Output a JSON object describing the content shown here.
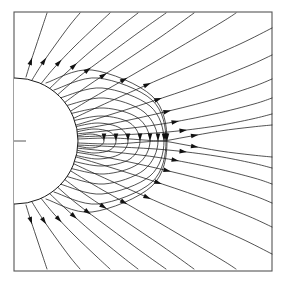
{
  "figure": {
    "title": "",
    "caption": "",
    "kind": "field-line-diagram",
    "background_color": "#ffffff",
    "line_color": "#1a1a1a",
    "frame_color": "#555555"
  },
  "frame": {
    "x": 14,
    "y": 12,
    "width": 258,
    "height": 259,
    "stroke_width": 1.1
  },
  "body": {
    "name": "central-sphere",
    "center_x": 15,
    "center_y": 141,
    "radius": 63,
    "fill": "#ffffff",
    "stroke": "#1a1a1a",
    "visible_portion": "right half"
  },
  "equator_tick": {
    "x1": 14,
    "x2": 26,
    "y": 141
  },
  "chart_data": {
    "type": "line",
    "title": "",
    "xlabel": "",
    "ylabel": "",
    "xlim": [
      14,
      272
    ],
    "ylim": [
      12,
      271
    ],
    "grid": false,
    "legend": null,
    "annotations": [
      {
        "label": "neutral-point",
        "x": 166,
        "y": 141
      },
      {
        "label": "equator-tick-left",
        "x": 20,
        "y": 141
      },
      {
        "label": "equator-exit-right",
        "x": 272,
        "y": 141
      }
    ],
    "arrow_count": 39,
    "open_lines_upper": 12,
    "open_lines_lower": 12,
    "closed_loops": 9,
    "series": [
      {
        "name": "open-upper-1",
        "arrow_t": 0.3,
        "points": [
          [
            26,
            77
          ],
          [
            30,
            64
          ],
          [
            36,
            46
          ],
          [
            42,
            28
          ],
          [
            47,
            13
          ]
        ]
      },
      {
        "name": "open-upper-2",
        "arrow_t": 0.32,
        "points": [
          [
            32,
            80
          ],
          [
            42,
            64
          ],
          [
            56,
            44
          ],
          [
            70,
            25
          ],
          [
            80,
            13
          ]
        ]
      },
      {
        "name": "open-upper-3",
        "arrow_t": 0.33,
        "points": [
          [
            40,
            85
          ],
          [
            54,
            68
          ],
          [
            74,
            47
          ],
          [
            96,
            26
          ],
          [
            110,
            13
          ]
        ]
      },
      {
        "name": "open-upper-4",
        "arrow_t": 0.34,
        "points": [
          [
            47,
            91
          ],
          [
            66,
            73
          ],
          [
            92,
            50
          ],
          [
            120,
            27
          ],
          [
            138,
            13
          ]
        ]
      },
      {
        "name": "open-upper-5",
        "arrow_t": 0.34,
        "points": [
          [
            54,
            98
          ],
          [
            76,
            79
          ],
          [
            108,
            55
          ],
          [
            142,
            30
          ],
          [
            166,
            13
          ]
        ]
      },
      {
        "name": "open-upper-6",
        "arrow_t": 0.35,
        "points": [
          [
            60,
            106
          ],
          [
            86,
            87
          ],
          [
            122,
            63
          ],
          [
            162,
            36
          ],
          [
            194,
            13
          ]
        ]
      },
      {
        "name": "open-upper-7",
        "arrow_t": 0.36,
        "points": [
          [
            66,
            114
          ],
          [
            94,
            97
          ],
          [
            134,
            74
          ],
          [
            180,
            47
          ],
          [
            222,
            22
          ],
          [
            236,
            13
          ]
        ]
      },
      {
        "name": "open-upper-8",
        "arrow_t": 0.4,
        "points": [
          [
            70,
            120
          ],
          [
            100,
            106
          ],
          [
            142,
            87
          ],
          [
            190,
            66
          ],
          [
            240,
            44
          ],
          [
            272,
            28
          ]
        ]
      },
      {
        "name": "open-upper-9",
        "arrow_t": 0.44,
        "points": [
          [
            73,
            126
          ],
          [
            106,
            116
          ],
          [
            150,
            102
          ],
          [
            200,
            85
          ],
          [
            248,
            66
          ],
          [
            272,
            55
          ]
        ]
      },
      {
        "name": "open-upper-10",
        "arrow_t": 0.48,
        "points": [
          [
            75,
            130
          ],
          [
            110,
            124
          ],
          [
            156,
            114
          ],
          [
            208,
            101
          ],
          [
            252,
            87
          ],
          [
            272,
            79
          ]
        ]
      },
      {
        "name": "open-upper-11",
        "arrow_t": 0.52,
        "points": [
          [
            76,
            134
          ],
          [
            114,
            130
          ],
          [
            162,
            124
          ],
          [
            214,
            114
          ],
          [
            254,
            104
          ],
          [
            272,
            98
          ]
        ]
      },
      {
        "name": "open-upper-12",
        "arrow_t": 0.56,
        "points": [
          [
            77,
            137
          ],
          [
            120,
            135
          ],
          [
            168,
            132
          ],
          [
            216,
            126
          ],
          [
            252,
            119
          ],
          [
            272,
            114
          ]
        ]
      },
      {
        "name": "separatrix-upper",
        "arrow_t": 0.62,
        "points": [
          [
            78,
            139
          ],
          [
            112,
            138
          ],
          [
            144,
            140
          ],
          [
            162,
            141
          ],
          [
            186,
            137
          ],
          [
            220,
            131
          ],
          [
            252,
            127
          ],
          [
            272,
            125
          ]
        ]
      },
      {
        "name": "separatrix-lower",
        "arrow_t": 0.62,
        "points": [
          [
            78,
            143
          ],
          [
            112,
            144
          ],
          [
            144,
            142
          ],
          [
            162,
            141
          ],
          [
            186,
            145
          ],
          [
            220,
            151
          ],
          [
            252,
            155
          ],
          [
            272,
            157
          ]
        ]
      },
      {
        "name": "open-lower-12",
        "arrow_t": 0.56,
        "points": [
          [
            77,
            145
          ],
          [
            120,
            147
          ],
          [
            168,
            150
          ],
          [
            216,
            156
          ],
          [
            252,
            163
          ],
          [
            272,
            168
          ]
        ]
      },
      {
        "name": "open-lower-11",
        "arrow_t": 0.52,
        "points": [
          [
            76,
            148
          ],
          [
            114,
            152
          ],
          [
            162,
            158
          ],
          [
            214,
            168
          ],
          [
            254,
            178
          ],
          [
            272,
            184
          ]
        ]
      },
      {
        "name": "open-lower-10",
        "arrow_t": 0.48,
        "points": [
          [
            75,
            152
          ],
          [
            110,
            158
          ],
          [
            156,
            168
          ],
          [
            208,
            181
          ],
          [
            252,
            195
          ],
          [
            272,
            203
          ]
        ]
      },
      {
        "name": "open-lower-9",
        "arrow_t": 0.44,
        "points": [
          [
            73,
            156
          ],
          [
            106,
            166
          ],
          [
            150,
            180
          ],
          [
            200,
            197
          ],
          [
            248,
            216
          ],
          [
            272,
            227
          ]
        ]
      },
      {
        "name": "open-lower-8",
        "arrow_t": 0.4,
        "points": [
          [
            70,
            162
          ],
          [
            100,
            176
          ],
          [
            142,
            195
          ],
          [
            190,
            216
          ],
          [
            240,
            238
          ],
          [
            272,
            254
          ]
        ]
      },
      {
        "name": "open-lower-7",
        "arrow_t": 0.36,
        "points": [
          [
            66,
            168
          ],
          [
            94,
            185
          ],
          [
            134,
            208
          ],
          [
            180,
            235
          ],
          [
            222,
            260
          ],
          [
            236,
            269
          ]
        ]
      },
      {
        "name": "open-lower-6",
        "arrow_t": 0.35,
        "points": [
          [
            60,
            176
          ],
          [
            86,
            195
          ],
          [
            122,
            219
          ],
          [
            162,
            246
          ],
          [
            194,
            269
          ]
        ]
      },
      {
        "name": "open-lower-5",
        "arrow_t": 0.34,
        "points": [
          [
            54,
            184
          ],
          [
            76,
            203
          ],
          [
            108,
            227
          ],
          [
            142,
            252
          ],
          [
            166,
            269
          ]
        ]
      },
      {
        "name": "open-lower-4",
        "arrow_t": 0.34,
        "points": [
          [
            47,
            191
          ],
          [
            66,
            209
          ],
          [
            92,
            232
          ],
          [
            120,
            255
          ],
          [
            138,
            269
          ]
        ]
      },
      {
        "name": "open-lower-3",
        "arrow_t": 0.33,
        "points": [
          [
            40,
            197
          ],
          [
            54,
            214
          ],
          [
            74,
            235
          ],
          [
            96,
            256
          ],
          [
            110,
            269
          ]
        ]
      },
      {
        "name": "open-lower-2",
        "arrow_t": 0.32,
        "points": [
          [
            32,
            202
          ],
          [
            42,
            218
          ],
          [
            56,
            238
          ],
          [
            70,
            257
          ],
          [
            80,
            269
          ]
        ]
      },
      {
        "name": "open-lower-1",
        "arrow_t": 0.3,
        "points": [
          [
            26,
            205
          ],
          [
            30,
            218
          ],
          [
            36,
            236
          ],
          [
            42,
            254
          ],
          [
            47,
            269
          ]
        ]
      },
      {
        "name": "closed-loop-1",
        "arrow_t": 0.5,
        "points": [
          [
            77,
            136
          ],
          [
            90,
            134
          ],
          [
            100,
            136
          ],
          [
            104,
            141
          ],
          [
            100,
            146
          ],
          [
            90,
            148
          ],
          [
            77,
            146
          ]
        ]
      },
      {
        "name": "closed-loop-2",
        "arrow_t": 0.5,
        "points": [
          [
            76,
            132
          ],
          [
            94,
            129
          ],
          [
            110,
            132
          ],
          [
            116,
            141
          ],
          [
            110,
            150
          ],
          [
            94,
            153
          ],
          [
            76,
            150
          ]
        ]
      },
      {
        "name": "closed-loop-3",
        "arrow_t": 0.5,
        "points": [
          [
            74,
            127
          ],
          [
            98,
            123
          ],
          [
            120,
            128
          ],
          [
            128,
            141
          ],
          [
            120,
            154
          ],
          [
            98,
            159
          ],
          [
            74,
            155
          ]
        ]
      },
      {
        "name": "closed-loop-4",
        "arrow_t": 0.5,
        "points": [
          [
            72,
            121
          ],
          [
            102,
            116
          ],
          [
            130,
            123
          ],
          [
            140,
            141
          ],
          [
            130,
            159
          ],
          [
            102,
            166
          ],
          [
            72,
            161
          ]
        ]
      },
      {
        "name": "closed-loop-5",
        "arrow_t": 0.5,
        "points": [
          [
            69,
            114
          ],
          [
            104,
            108
          ],
          [
            138,
            118
          ],
          [
            150,
            141
          ],
          [
            138,
            164
          ],
          [
            104,
            174
          ],
          [
            69,
            168
          ]
        ]
      },
      {
        "name": "closed-loop-6",
        "arrow_t": 0.5,
        "points": [
          [
            65,
            106
          ],
          [
            104,
            98
          ],
          [
            144,
            112
          ],
          [
            158,
            141
          ],
          [
            144,
            170
          ],
          [
            104,
            184
          ],
          [
            65,
            176
          ]
        ]
      },
      {
        "name": "closed-loop-7",
        "arrow_t": 0.5,
        "points": [
          [
            60,
            98
          ],
          [
            102,
            88
          ],
          [
            150,
            106
          ],
          [
            164,
            141
          ],
          [
            150,
            176
          ],
          [
            102,
            194
          ],
          [
            60,
            184
          ]
        ]
      },
      {
        "name": "closed-loop-8",
        "arrow_t": 0.5,
        "points": [
          [
            54,
            90
          ],
          [
            98,
            78
          ],
          [
            152,
            100
          ],
          [
            166,
            141
          ],
          [
            152,
            182
          ],
          [
            98,
            204
          ],
          [
            54,
            192
          ]
        ]
      },
      {
        "name": "closed-loop-9",
        "arrow_t": 0.5,
        "points": [
          [
            46,
            83
          ],
          [
            92,
            70
          ],
          [
            152,
            96
          ],
          [
            167,
            141
          ],
          [
            152,
            186
          ],
          [
            92,
            212
          ],
          [
            46,
            199
          ]
        ]
      }
    ]
  }
}
